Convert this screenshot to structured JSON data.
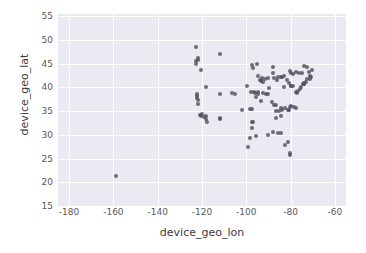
{
  "chart_data": {
    "type": "scatter",
    "title": "",
    "xlabel": "device_geo_lon",
    "ylabel": "device_geo_lat",
    "xlim": [
      -185,
      -55
    ],
    "ylim": [
      15,
      55.5
    ],
    "xticks": [
      "-180",
      "-160",
      "-140",
      "-120",
      "-100",
      "-80",
      "-60"
    ],
    "xtick_values": [
      -180,
      -160,
      -140,
      -120,
      -100,
      -80,
      -60
    ],
    "yticks": [
      "15",
      "20",
      "25",
      "30",
      "35",
      "40",
      "45",
      "50",
      "55"
    ],
    "ytick_values": [
      15,
      20,
      25,
      30,
      35,
      40,
      45,
      50,
      55
    ],
    "grid": true,
    "legend": null,
    "marker_color": "#4f5060",
    "plot_background": "#eaeaf2",
    "grid_color": "#ffffff",
    "n_points": 118,
    "points": [
      [
        -158.9,
        21.3
      ],
      [
        -122.7,
        48.5
      ],
      [
        -122.6,
        45.5
      ],
      [
        -122.5,
        45.0
      ],
      [
        -121.9,
        46.2
      ],
      [
        -121.8,
        45.8
      ],
      [
        -120.5,
        43.6
      ],
      [
        -112.1,
        47.0
      ],
      [
        -118.2,
        40.1
      ],
      [
        -122.3,
        38.6
      ],
      [
        -122.2,
        38.3
      ],
      [
        -122.1,
        37.8
      ],
      [
        -121.9,
        37.4
      ],
      [
        -121.6,
        36.6
      ],
      [
        -112.0,
        38.7
      ],
      [
        -106.6,
        38.8
      ],
      [
        -104.9,
        38.7
      ],
      [
        -120.9,
        34.2
      ],
      [
        -120.6,
        34.0
      ],
      [
        -119.8,
        34.4
      ],
      [
        -119.2,
        33.8
      ],
      [
        -118.4,
        33.9
      ],
      [
        -118.2,
        33.4
      ],
      [
        -117.9,
        32.7
      ],
      [
        -112.1,
        33.4
      ],
      [
        -111.9,
        33.5
      ],
      [
        -99.7,
        40.4
      ],
      [
        -97.5,
        44.8
      ],
      [
        -96.8,
        44.2
      ],
      [
        -95.3,
        44.9
      ],
      [
        -94.5,
        42.4
      ],
      [
        -93.6,
        41.6
      ],
      [
        -93.2,
        41.3
      ],
      [
        -92.9,
        42.0
      ],
      [
        -92.6,
        41.1
      ],
      [
        -91.5,
        41.7
      ],
      [
        -90.2,
        41.9
      ],
      [
        -88.0,
        44.4
      ],
      [
        -87.9,
        43.0
      ],
      [
        -87.6,
        41.9
      ],
      [
        -86.3,
        41.6
      ],
      [
        -85.6,
        42.3
      ],
      [
        -84.5,
        42.3
      ],
      [
        -83.8,
        42.3
      ],
      [
        -83.0,
        42.4
      ],
      [
        -82.9,
        40.0
      ],
      [
        -81.7,
        41.5
      ],
      [
        -80.9,
        41.0
      ],
      [
        -80.0,
        40.4
      ],
      [
        -79.9,
        40.4
      ],
      [
        -78.9,
        40.3
      ],
      [
        -77.4,
        39.0
      ],
      [
        -77.0,
        38.9
      ],
      [
        -76.6,
        39.3
      ],
      [
        -75.6,
        39.7
      ],
      [
        -75.2,
        40.0
      ],
      [
        -74.6,
        40.7
      ],
      [
        -74.0,
        40.7
      ],
      [
        -73.9,
        40.8
      ],
      [
        -73.8,
        41.0
      ],
      [
        -73.2,
        41.2
      ],
      [
        -72.7,
        41.8
      ],
      [
        -71.4,
        41.8
      ],
      [
        -71.1,
        42.4
      ],
      [
        -70.9,
        42.3
      ],
      [
        -70.3,
        43.7
      ],
      [
        -71.5,
        43.2
      ],
      [
        -72.6,
        44.3
      ],
      [
        -73.8,
        44.5
      ],
      [
        -75.0,
        43.0
      ],
      [
        -76.1,
        43.0
      ],
      [
        -77.6,
        43.2
      ],
      [
        -78.8,
        42.9
      ],
      [
        -79.9,
        43.1
      ],
      [
        -80.5,
        43.5
      ],
      [
        -97.8,
        39.1
      ],
      [
        -96.7,
        39.0
      ],
      [
        -95.9,
        38.9
      ],
      [
        -95.4,
        38.0
      ],
      [
        -94.6,
        39.1
      ],
      [
        -94.5,
        38.6
      ],
      [
        -93.3,
        37.2
      ],
      [
        -92.3,
        38.9
      ],
      [
        -91.2,
        38.6
      ],
      [
        -90.2,
        38.6
      ],
      [
        -89.6,
        39.8
      ],
      [
        -88.3,
        37.0
      ],
      [
        -87.3,
        36.2
      ],
      [
        -86.8,
        36.2
      ],
      [
        -86.5,
        35.0
      ],
      [
        -85.3,
        35.0
      ],
      [
        -84.4,
        35.6
      ],
      [
        -84.3,
        34.0
      ],
      [
        -83.9,
        35.2
      ],
      [
        -82.6,
        35.6
      ],
      [
        -81.2,
        35.2
      ],
      [
        -80.8,
        35.2
      ],
      [
        -80.2,
        35.8
      ],
      [
        -79.8,
        36.1
      ],
      [
        -78.6,
        35.8
      ],
      [
        -77.4,
        35.6
      ],
      [
        -98.5,
        35.5
      ],
      [
        -97.5,
        35.5
      ],
      [
        -97.3,
        32.8
      ],
      [
        -96.8,
        32.8
      ],
      [
        -95.4,
        29.8
      ],
      [
        -98.5,
        29.4
      ],
      [
        -99.1,
        27.5
      ],
      [
        -97.4,
        31.5
      ],
      [
        -101.8,
        35.2
      ],
      [
        -90.1,
        30.0
      ],
      [
        -88.0,
        30.7
      ],
      [
        -86.8,
        33.5
      ],
      [
        -85.8,
        30.4
      ],
      [
        -84.3,
        30.4
      ],
      [
        -82.5,
        27.9
      ],
      [
        -81.4,
        28.5
      ],
      [
        -80.2,
        26.1
      ],
      [
        -80.1,
        25.8
      ]
    ]
  }
}
